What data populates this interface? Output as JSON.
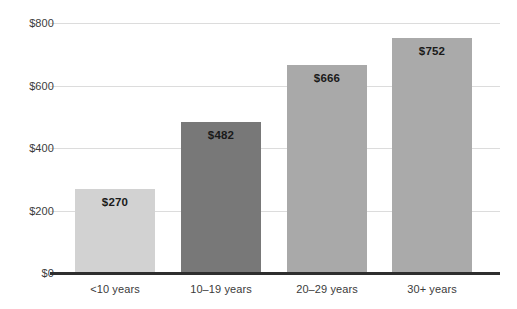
{
  "chart_data": {
    "type": "bar",
    "title": "",
    "subtitle": "",
    "xlabel": "",
    "ylabel": "",
    "categories": [
      "<10 years",
      "10–19 years",
      "20–29 years",
      "30+ years"
    ],
    "values": [
      270,
      482,
      666,
      752
    ],
    "data_labels": [
      "$270",
      "$482",
      "$666",
      "$752"
    ],
    "ylim": [
      0,
      800
    ],
    "yticks": [
      0,
      200,
      400,
      600,
      800
    ],
    "ytick_labels": [
      "$0",
      "$200",
      "$400",
      "$600",
      "$800"
    ],
    "grid": true,
    "grid_axis": "y",
    "legend": false,
    "legend_position": "none",
    "bar_colors": [
      "#d2d2d2",
      "#787878",
      "#a9a9a9",
      "#aaaaaa"
    ],
    "axis_color": "#2e2e2e",
    "gridline_color": "#dcdcdc",
    "label_text_color": "#3b3b3b",
    "value_text_color": "#1a1a1a"
  }
}
